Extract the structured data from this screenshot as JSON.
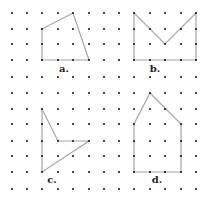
{
  "grid": {
    "cols": [
      12,
      27,
      42,
      58,
      73,
      89,
      104,
      119,
      134,
      150,
      165,
      181,
      196
    ],
    "rows": [
      13,
      29,
      44,
      60,
      77,
      93,
      109,
      124,
      141,
      156,
      172,
      189
    ],
    "dot_color": "#1a1a1a",
    "dot_radius": 1.1
  },
  "line_color": "#a6a6a6",
  "shapes": [
    {
      "id": "a",
      "label": "a.",
      "label_pos": [
        64,
        72
      ],
      "vertices": [
        [
          2,
          1
        ],
        [
          4,
          0
        ],
        [
          5,
          3
        ],
        [
          2,
          3
        ]
      ]
    },
    {
      "id": "b",
      "label": "b.",
      "label_pos": [
        155,
        72
      ],
      "vertices": [
        [
          8,
          0
        ],
        [
          10,
          2
        ],
        [
          12,
          0
        ],
        [
          12,
          3
        ],
        [
          8,
          3
        ]
      ]
    },
    {
      "id": "c",
      "label": "c.",
      "label_pos": [
        52,
        183
      ],
      "vertices": [
        [
          2,
          6
        ],
        [
          3,
          8
        ],
        [
          5,
          8
        ],
        [
          2,
          10
        ]
      ]
    },
    {
      "id": "d",
      "label": "d.",
      "label_pos": [
        157,
        183
      ],
      "vertices": [
        [
          9,
          5
        ],
        [
          11,
          7
        ],
        [
          11,
          10
        ],
        [
          8,
          10
        ],
        [
          8,
          7
        ]
      ]
    }
  ]
}
